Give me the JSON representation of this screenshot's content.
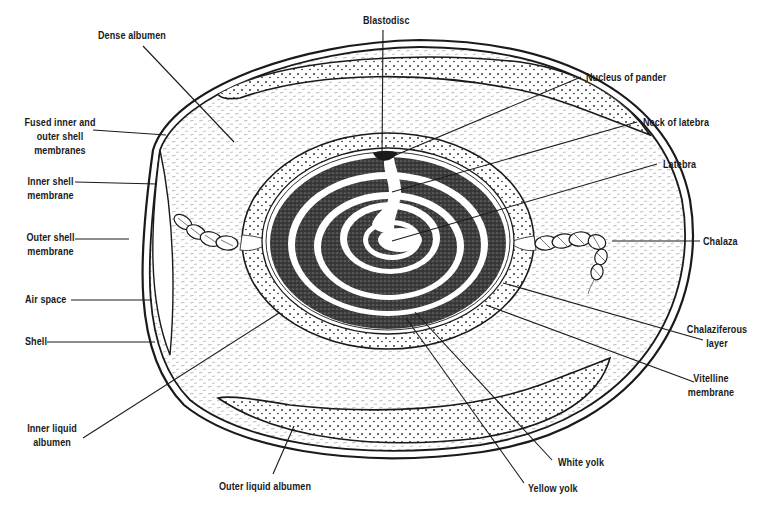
{
  "diagram": {
    "colors": {
      "ink": "#1a1a1a",
      "background": "#ffffff",
      "yolk_dark": "#2a2a2a",
      "albumen_hatch": "#9a9a9a"
    },
    "labels": {
      "dense_albumen": "Dense albumen",
      "fused_membranes": "Fused inner and\nouter shell\nmembranes",
      "inner_shell_membrane": "Inner shell\nmembrane",
      "outer_shell_membrane": "Outer shell\nmembrane",
      "air_space": "Air space",
      "shell": "Shell",
      "inner_liquid_albumen": "Inner liquid\nalbumen",
      "outer_liquid_albumen": "Outer liquid albumen",
      "blastodisc": "Blastodisc",
      "nucleus_of_pander": "Nucleus of pander",
      "neck_of_latebra": "Neck of latebra",
      "latebra": "Latebra",
      "chalaza": "Chalaza",
      "chalaziferous_layer": "Chalaziferous\nlayer",
      "vitelline_membrane": "Vitelline\nmembrane",
      "white_yolk": "White yolk",
      "yellow_yolk": "Yellow yolk"
    }
  }
}
